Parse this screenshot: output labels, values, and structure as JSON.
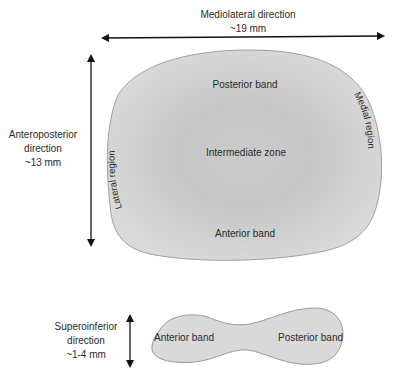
{
  "colors": {
    "disc_fill": "#d6d6d6",
    "disc_center": "#c4c4c4",
    "disc_outline": "#9a9a9a",
    "arrow": "#111111",
    "text": "#2a2a2a"
  },
  "mediolateral": {
    "label": "Mediolateral direction",
    "size": "~19 mm"
  },
  "anteroposterior": {
    "label_line1": "Anteroposterior",
    "label_line2": "direction",
    "size": "~13 mm"
  },
  "superoinferior": {
    "label_line1": "Superoinferior",
    "label_line2": "direction",
    "size": "~1-4 mm"
  },
  "top_view": {
    "posterior_band": "Posterior band",
    "intermediate_zone": "Intermediate zone",
    "anterior_band": "Anterior band",
    "lateral_region": "Lateral region",
    "medial_region": "Medial region"
  },
  "side_view": {
    "anterior_band": "Anterior band",
    "posterior_band": "Posterior band"
  }
}
